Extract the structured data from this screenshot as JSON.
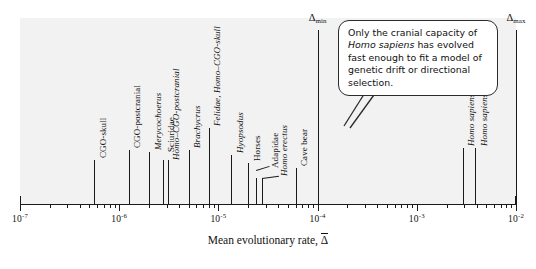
{
  "chart_data": {
    "type": "scatter",
    "orientation": "horizontal-strip",
    "title": "",
    "xlabel": "Mean evolutionary rate, Δ̄",
    "ylabel": "",
    "xscale": "log",
    "xlim": [
      1e-07,
      0.01
    ],
    "grid": false,
    "legend": null,
    "axis_tick_labels": [
      "10⁻⁷",
      "10⁻⁶",
      "10⁻⁵",
      "10⁻⁴",
      "10⁻³",
      "10⁻²"
    ],
    "axis_tick_exponents": [
      -7,
      -6,
      -5,
      -4,
      -3,
      -2
    ],
    "points": [
      {
        "label": "CGO-skull",
        "value": 5.6e-07,
        "italic": false
      },
      {
        "label": "CGO-postcranial",
        "value": 1.25e-06,
        "italic": false
      },
      {
        "label": "Merycochoerus",
        "value": 2e-06,
        "italic": true
      },
      {
        "label": "Sciuridae",
        "value": 2.75e-06,
        "italic": false
      },
      {
        "label": "Homo–CGO-postcranial",
        "value": 3.1e-06,
        "italic": true
      },
      {
        "label": "Brachycrus",
        "value": 5e-06,
        "italic": true
      },
      {
        "label": "Felidae, Homo–CGO-skull",
        "value": 8e-06,
        "italic": true
      },
      {
        "label": "Hyopsodus",
        "value": 1.35e-05,
        "italic": true
      },
      {
        "label": "Horses",
        "value": 2e-05,
        "italic": false
      },
      {
        "label": "Adapidae",
        "value": 2.4e-05,
        "italic": false
      },
      {
        "label": "Homo erectus",
        "value": 2.75e-05,
        "italic": true
      },
      {
        "label": "Cave bear",
        "value": 6e-05,
        "italic": false
      },
      {
        "label": "Homo sapiens",
        "value": 0.0029,
        "italic": true
      },
      {
        "label": "Homo sapiens",
        "value": 0.0039,
        "italic": true
      }
    ],
    "boundaries": [
      {
        "name": "delta-min",
        "label": "Δ",
        "subscript": "min",
        "value": 0.0001
      },
      {
        "name": "delta-max",
        "label": "Δ",
        "subscript": "max",
        "value": 0.01
      }
    ],
    "annotations": [
      {
        "name": "cranial-capacity-callout",
        "lines": [
          {
            "text": "Only the cranial capacity of",
            "italic_part": ""
          },
          {
            "text": "Homo sapiens has evolved",
            "italic_part": "Homo sapiens"
          },
          {
            "text": "fast enough to fit a model",
            "italic_part": ""
          },
          {
            "text": "of genetic drift or directional",
            "italic_part": ""
          },
          {
            "text": "selection.",
            "italic_part": ""
          }
        ],
        "points_to": "Homo sapiens"
      }
    ]
  },
  "colors": {
    "panel_background": "#f2f2f2",
    "page_background": "#ffffff",
    "ink": "#1a1a1a",
    "callout_border": "#2b2b2b"
  },
  "axis": {
    "title_prefix": "Mean evolutionary rate, ",
    "title_symbol": "Δ"
  },
  "callout": {
    "line1": "Only the cranial capacity of",
    "line2_italic": "Homo sapiens",
    "line2_rest": " has evolved",
    "line3": "fast enough to fit a model",
    "line4": "of genetic drift or directional",
    "line5": "selection."
  }
}
